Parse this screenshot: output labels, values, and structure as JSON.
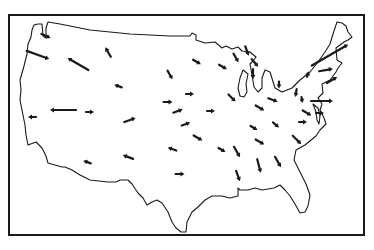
{
  "map": {
    "title": "Vector field over the continental United States",
    "frame": {
      "x": 9,
      "y": 15,
      "width": 355,
      "height": 220
    },
    "colors": {
      "ink": "#1a1a1a",
      "background": "#ffffff"
    },
    "regions": [
      "continental-us-outline",
      "great-lakes",
      "chesapeake-bay"
    ],
    "arrows": [
      {
        "x": 46,
        "y": 36,
        "angle": 25,
        "length": 10
      },
      {
        "x": 38,
        "y": 55,
        "angle": 20,
        "length": 24
      },
      {
        "x": 78,
        "y": 64,
        "angle": 210,
        "length": 24
      },
      {
        "x": 108,
        "y": 52,
        "angle": 240,
        "length": 11
      },
      {
        "x": 118,
        "y": 86,
        "angle": 200,
        "length": 8
      },
      {
        "x": 63,
        "y": 110,
        "angle": 180,
        "length": 26
      },
      {
        "x": 32,
        "y": 117,
        "angle": 180,
        "length": 8
      },
      {
        "x": 90,
        "y": 112,
        "angle": 0,
        "length": 8
      },
      {
        "x": 130,
        "y": 120,
        "angle": 340,
        "length": 12
      },
      {
        "x": 170,
        "y": 75,
        "angle": 60,
        "length": 10
      },
      {
        "x": 168,
        "y": 102,
        "angle": 0,
        "length": 9
      },
      {
        "x": 178,
        "y": 111,
        "angle": 340,
        "length": 10
      },
      {
        "x": 186,
        "y": 124,
        "angle": 340,
        "length": 9
      },
      {
        "x": 197,
        "y": 62,
        "angle": 30,
        "length": 9
      },
      {
        "x": 223,
        "y": 67,
        "angle": 30,
        "length": 9
      },
      {
        "x": 232,
        "y": 98,
        "angle": 45,
        "length": 10
      },
      {
        "x": 190,
        "y": 94,
        "angle": 0,
        "length": 8
      },
      {
        "x": 211,
        "y": 111,
        "angle": 0,
        "length": 8
      },
      {
        "x": 236,
        "y": 58,
        "angle": 60,
        "length": 10
      },
      {
        "x": 255,
        "y": 63,
        "angle": 50,
        "length": 10
      },
      {
        "x": 253,
        "y": 74,
        "angle": 90,
        "length": 10
      },
      {
        "x": 247,
        "y": 51,
        "angle": 70,
        "length": 10
      },
      {
        "x": 198,
        "y": 138,
        "angle": 30,
        "length": 10
      },
      {
        "x": 222,
        "y": 150,
        "angle": 30,
        "length": 8
      },
      {
        "x": 260,
        "y": 108,
        "angle": 30,
        "length": 10
      },
      {
        "x": 273,
        "y": 100,
        "angle": 20,
        "length": 10
      },
      {
        "x": 279,
        "y": 85,
        "angle": 90,
        "length": 7
      },
      {
        "x": 296,
        "y": 93,
        "angle": 100,
        "length": 8
      },
      {
        "x": 303,
        "y": 122,
        "angle": 0,
        "length": 8
      },
      {
        "x": 307,
        "y": 113,
        "angle": 30,
        "length": 10
      },
      {
        "x": 254,
        "y": 128,
        "angle": 30,
        "length": 8
      },
      {
        "x": 260,
        "y": 142,
        "angle": 30,
        "length": 10
      },
      {
        "x": 237,
        "y": 152,
        "angle": 60,
        "length": 12
      },
      {
        "x": 259,
        "y": 166,
        "angle": 75,
        "length": 14
      },
      {
        "x": 278,
        "y": 162,
        "angle": 60,
        "length": 12
      },
      {
        "x": 238,
        "y": 176,
        "angle": 70,
        "length": 11
      },
      {
        "x": 172,
        "y": 149,
        "angle": 200,
        "length": 9
      },
      {
        "x": 128,
        "y": 157,
        "angle": 200,
        "length": 11
      },
      {
        "x": 87,
        "y": 162,
        "angle": 200,
        "length": 8
      },
      {
        "x": 180,
        "y": 174,
        "angle": 0,
        "length": 9
      },
      {
        "x": 276,
        "y": 125,
        "angle": 40,
        "length": 8
      },
      {
        "x": 297,
        "y": 140,
        "angle": 45,
        "length": 12
      },
      {
        "x": 330,
        "y": 55,
        "angle": 330,
        "length": 42
      },
      {
        "x": 326,
        "y": 70,
        "angle": 350,
        "length": 14
      },
      {
        "x": 332,
        "y": 80,
        "angle": 330,
        "length": 12
      },
      {
        "x": 322,
        "y": 101,
        "angle": 0,
        "length": 22
      },
      {
        "x": 308,
        "y": 74,
        "angle": 290,
        "length": 6
      },
      {
        "x": 302,
        "y": 100,
        "angle": 80,
        "length": 6
      },
      {
        "x": 320,
        "y": 113,
        "angle": 0,
        "length": 8
      }
    ]
  }
}
